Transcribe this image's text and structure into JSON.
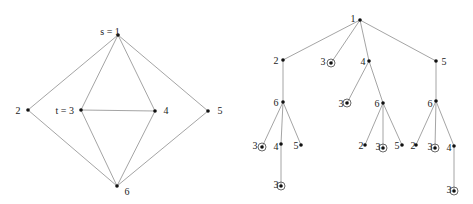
{
  "left_graph": {
    "nodes": [
      {
        "id": "1",
        "label": "s = 1",
        "x": 118,
        "y": 35,
        "lx": 110,
        "ly": 32,
        "anchor": "middle"
      },
      {
        "id": "2",
        "label": "2",
        "x": 28,
        "y": 110,
        "lx": 18,
        "ly": 111,
        "anchor": "middle"
      },
      {
        "id": "3",
        "label": "t = 3",
        "x": 81,
        "y": 110,
        "lx": 74,
        "ly": 111,
        "anchor": "end"
      },
      {
        "id": "4",
        "label": "4",
        "x": 155,
        "y": 111,
        "lx": 166,
        "ly": 111,
        "anchor": "middle"
      },
      {
        "id": "5",
        "label": "5",
        "x": 208,
        "y": 111,
        "lx": 220,
        "ly": 111,
        "anchor": "middle"
      },
      {
        "id": "6",
        "label": "6",
        "x": 117,
        "y": 186,
        "lx": 127,
        "ly": 192,
        "anchor": "middle"
      }
    ],
    "edges": [
      [
        "1",
        "2"
      ],
      [
        "1",
        "3"
      ],
      [
        "1",
        "4"
      ],
      [
        "1",
        "5"
      ],
      [
        "3",
        "4"
      ],
      [
        "2",
        "6"
      ],
      [
        "3",
        "6"
      ],
      [
        "4",
        "6"
      ],
      [
        "5",
        "6"
      ]
    ]
  },
  "right_tree": {
    "nodes": [
      {
        "id": "r",
        "label": "1",
        "x": 360,
        "y": 20,
        "lx": 353,
        "ly": 19,
        "target": false
      },
      {
        "id": "a2",
        "label": "2",
        "x": 283,
        "y": 60,
        "lx": 276,
        "ly": 61,
        "target": false
      },
      {
        "id": "a3",
        "label": "3",
        "x": 331,
        "y": 63,
        "lx": 323,
        "ly": 62,
        "target": true
      },
      {
        "id": "a4",
        "label": "4",
        "x": 369,
        "y": 61,
        "lx": 363,
        "ly": 62,
        "target": false
      },
      {
        "id": "a5",
        "label": "5",
        "x": 436,
        "y": 61,
        "lx": 444,
        "ly": 62,
        "target": false
      },
      {
        "id": "b6a",
        "label": "6",
        "x": 283,
        "y": 102,
        "lx": 276,
        "ly": 103,
        "target": false
      },
      {
        "id": "b3",
        "label": "3",
        "x": 347,
        "y": 103,
        "lx": 341,
        "ly": 104,
        "target": true
      },
      {
        "id": "b6b",
        "label": "6",
        "x": 383,
        "y": 103,
        "lx": 377,
        "ly": 104,
        "target": false
      },
      {
        "id": "b6c",
        "label": "6",
        "x": 436,
        "y": 101,
        "lx": 430,
        "ly": 104,
        "target": false
      },
      {
        "id": "c3a",
        "label": "3",
        "x": 262,
        "y": 147,
        "lx": 255,
        "ly": 146,
        "target": true
      },
      {
        "id": "c4a",
        "label": "4",
        "x": 281,
        "y": 144,
        "lx": 276,
        "ly": 147,
        "target": false
      },
      {
        "id": "c5a",
        "label": "5",
        "x": 301,
        "y": 145,
        "lx": 296,
        "ly": 146,
        "target": false
      },
      {
        "id": "c2b",
        "label": "2",
        "x": 365,
        "y": 145,
        "lx": 361,
        "ly": 146,
        "target": false
      },
      {
        "id": "c3b",
        "label": "3",
        "x": 383,
        "y": 148,
        "lx": 378,
        "ly": 147,
        "target": true
      },
      {
        "id": "c5b",
        "label": "5",
        "x": 402,
        "y": 145,
        "lx": 397,
        "ly": 146,
        "target": false
      },
      {
        "id": "c2c",
        "label": "2",
        "x": 416,
        "y": 145,
        "lx": 413,
        "ly": 146,
        "target": false
      },
      {
        "id": "c3c",
        "label": "3",
        "x": 435,
        "y": 148,
        "lx": 430,
        "ly": 147,
        "target": true
      },
      {
        "id": "c4c",
        "label": "4",
        "x": 454,
        "y": 146,
        "lx": 449,
        "ly": 148,
        "target": false
      },
      {
        "id": "d3a",
        "label": "3",
        "x": 281,
        "y": 186,
        "lx": 276,
        "ly": 185,
        "target": true
      },
      {
        "id": "d3c",
        "label": "3",
        "x": 454,
        "y": 191,
        "lx": 449,
        "ly": 190,
        "target": true
      }
    ],
    "edges": [
      [
        "r",
        "a2"
      ],
      [
        "r",
        "a3"
      ],
      [
        "r",
        "a4"
      ],
      [
        "r",
        "a5"
      ],
      [
        "a2",
        "b6a"
      ],
      [
        "a4",
        "b3"
      ],
      [
        "a4",
        "b6b"
      ],
      [
        "a5",
        "b6c"
      ],
      [
        "b6a",
        "c3a"
      ],
      [
        "b6a",
        "c4a"
      ],
      [
        "b6a",
        "c5a"
      ],
      [
        "b6b",
        "c2b"
      ],
      [
        "b6b",
        "c3b"
      ],
      [
        "b6b",
        "c5b"
      ],
      [
        "b6c",
        "c2c"
      ],
      [
        "b6c",
        "c3c"
      ],
      [
        "b6c",
        "c4c"
      ],
      [
        "c4a",
        "d3a"
      ],
      [
        "c4c",
        "d3c"
      ]
    ]
  },
  "colors": {
    "edge": "#9a9a9a",
    "node": "#111111",
    "background": "#ffffff"
  }
}
